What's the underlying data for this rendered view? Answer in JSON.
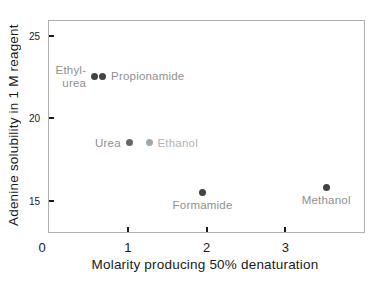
{
  "chart_data": {
    "type": "scatter",
    "title": "",
    "xlabel": "Molarity producing 50% denaturation",
    "ylabel": "Adenine solubility in 1 M reagent",
    "xlim": [
      0,
      4
    ],
    "ylim": [
      13.1,
      25.9
    ],
    "grid": false,
    "frame_color": "#b0b0b0",
    "tick_color": "#1a1a1a",
    "xticks": [
      {
        "label": "0",
        "x": 0,
        "mark": false,
        "dx": -7
      },
      {
        "label": "1",
        "x": 1,
        "mark": true,
        "dx": 0
      },
      {
        "label": "2",
        "x": 2,
        "mark": true,
        "dx": 0
      },
      {
        "label": "3",
        "x": 3,
        "mark": true,
        "dx": 0
      }
    ],
    "yticks": [
      {
        "label": "15",
        "y": 15
      },
      {
        "label": "20",
        "y": 20
      },
      {
        "label": "25",
        "y": 25
      }
    ],
    "points": [
      {
        "label": "Ethyl-\nurea",
        "x": 0.58,
        "y": 22.55,
        "dot_color": "#424242",
        "label_color": "#8f8f8f",
        "label_position": "left"
      },
      {
        "label": "Propionamide",
        "x": 0.68,
        "y": 22.55,
        "dot_color": "#424242",
        "label_color": "#8f8f8f",
        "label_position": "right"
      },
      {
        "label": "Urea",
        "x": 1.02,
        "y": 18.5,
        "dot_color": "#666666",
        "label_color": "#8f8f8f",
        "label_position": "left"
      },
      {
        "label": "Ethanol",
        "x": 1.27,
        "y": 18.5,
        "dot_color": "#a6a6a6",
        "label_color": "#b3b3b3",
        "label_position": "right"
      },
      {
        "label": "Formamide",
        "x": 1.95,
        "y": 15.5,
        "dot_color": "#424242",
        "label_color": "#8f8f8f",
        "label_position": "below"
      },
      {
        "label": "Methanol",
        "x": 3.52,
        "y": 15.8,
        "dot_color": "#424242",
        "label_color": "#8f8f8f",
        "label_position": "below"
      }
    ]
  }
}
